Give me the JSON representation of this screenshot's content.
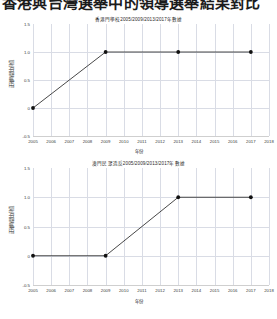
{
  "header": {
    "text": "香港與台灣選舉中的領導選舉結果對比"
  },
  "charts": [
    {
      "title": "香港門學校2005/2009/2013/2017年數據",
      "xlabel": "年份",
      "ylabel": "正確時間比例值",
      "x_ticks": [
        "2005",
        "2006",
        "2007",
        "2008",
        "2009",
        "2010",
        "2011",
        "2012",
        "2013",
        "2014",
        "2015",
        "2016",
        "2017",
        "2018"
      ],
      "y_ticks": [
        "1.5",
        "1.0",
        "0.5",
        "0",
        "-0.5"
      ]
    },
    {
      "title": "澳門民眾造反2005/2009/2013/2017年數據",
      "xlabel": "年份",
      "ylabel": "正確時間比例值",
      "x_ticks": [
        "2005",
        "2006",
        "2007",
        "2008",
        "2009",
        "2010",
        "2011",
        "2012",
        "2013",
        "2014",
        "2015",
        "2016",
        "2017",
        "2018"
      ],
      "y_ticks": [
        "1.5",
        "1.0",
        "0.5",
        "0",
        "-0.5"
      ]
    }
  ],
  "chart_data": [
    {
      "type": "line",
      "title": "香港門學校2005/2009/2013/2017年數據",
      "xlabel": "年份",
      "ylabel": "正確時間比例值",
      "x": [
        2005,
        2009,
        2013,
        2017
      ],
      "values": [
        0,
        1.0,
        1.0,
        1.0
      ],
      "xlim": [
        2005,
        2018
      ],
      "ylim": [
        -0.5,
        1.5
      ],
      "y_ticks": [
        1.5,
        1.0,
        0.5,
        0,
        -0.5
      ],
      "x_ticks": [
        2005,
        2006,
        2007,
        2008,
        2009,
        2010,
        2011,
        2012,
        2013,
        2014,
        2015,
        2016,
        2017,
        2018
      ],
      "grid": true,
      "legend": null,
      "marker": "circle",
      "line_color": "#333333",
      "marker_color": "#111111"
    },
    {
      "type": "line",
      "title": "澳門民眾造反2005/2009/2013/2017年數據",
      "xlabel": "年份",
      "ylabel": "正確時間比例值",
      "x": [
        2005,
        2009,
        2013,
        2017
      ],
      "values": [
        0,
        0,
        1.0,
        1.0
      ],
      "xlim": [
        2005,
        2018
      ],
      "ylim": [
        -0.5,
        1.5
      ],
      "y_ticks": [
        1.5,
        1.0,
        0.5,
        0,
        -0.5
      ],
      "x_ticks": [
        2005,
        2006,
        2007,
        2008,
        2009,
        2010,
        2011,
        2012,
        2013,
        2014,
        2015,
        2016,
        2017,
        2018
      ],
      "grid": true,
      "legend": null,
      "marker": "circle",
      "line_color": "#333333",
      "marker_color": "#111111"
    }
  ]
}
